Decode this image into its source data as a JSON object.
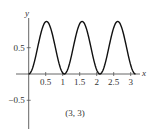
{
  "chart_data": {
    "type": "line",
    "title": "",
    "function": "y = sin^2(3x)",
    "xlabel": "x",
    "ylabel": "y",
    "xlim": [
      0,
      3.3
    ],
    "ylim": [
      -0.9,
      1.05
    ],
    "x_ticks": [
      0.5,
      1,
      1.5,
      2,
      2.5,
      3
    ],
    "x_tick_labels": [
      "0.5",
      "1",
      "1.5",
      "2",
      "2.5",
      "3"
    ],
    "y_ticks": [
      0.5,
      -0.5
    ],
    "y_tick_labels": [
      "0.5",
      "−0.5"
    ],
    "grid": false,
    "domain": [
      0,
      3.14159
    ],
    "series": [
      {
        "name": "sin^2(3x)",
        "x": [
          0,
          0.26,
          0.52,
          0.79,
          1.05,
          1.31,
          1.57,
          1.83,
          2.09,
          2.36,
          2.62,
          2.88,
          3.14
        ],
        "y": [
          0,
          0.5,
          1,
          0.5,
          0,
          0.5,
          1,
          0.5,
          0,
          0.5,
          1,
          0.5,
          0
        ]
      }
    ],
    "annotations": [
      {
        "text": "(3, 3)",
        "position": "below x-axis, center"
      }
    ]
  },
  "labels": {
    "x_axis": "x",
    "y_axis": "y",
    "annotation": "(3, 3)"
  },
  "colors": {
    "curve": "#111111",
    "axis": "#555555",
    "text": "#333333"
  }
}
